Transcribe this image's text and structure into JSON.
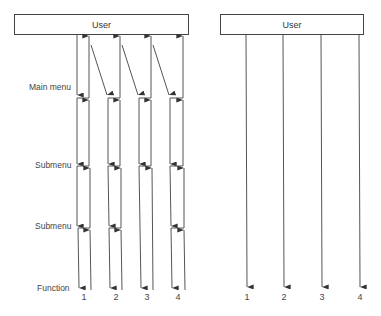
{
  "left_diagram": {
    "user_box": {
      "label": "User"
    },
    "levels": [
      {
        "label": "Main menu"
      },
      {
        "label": "Submenu"
      },
      {
        "label": "Submenu"
      },
      {
        "label": "Function"
      }
    ],
    "columns": [
      "1",
      "2",
      "3",
      "4"
    ],
    "notes": "Hierarchical menu: each function path descends through Main menu and Submenus; column 3 skips the second submenu junction; diagonal returns link each column's up-line to the next column's down-line."
  },
  "right_diagram": {
    "user_box": {
      "label": "User"
    },
    "columns": [
      "1",
      "2",
      "3",
      "4"
    ],
    "notes": "Direct access: each function reached by a single arrow from User."
  },
  "colors": {
    "line": "#444444",
    "text": "#444444",
    "background": "#ffffff"
  }
}
